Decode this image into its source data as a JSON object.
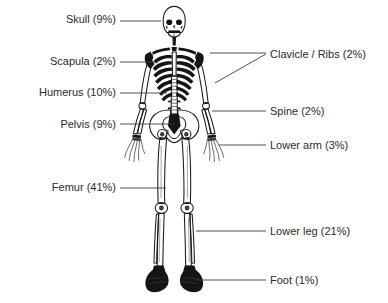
{
  "figure": {
    "background_color": "#ffffff",
    "text_color": "#2b2b2b",
    "line_color": "#3c3c3c",
    "bone_color": "#151515"
  },
  "labels": {
    "skull": {
      "text": "Skull (9%)",
      "side": "left",
      "x": 46,
      "y": 13,
      "width": 70
    },
    "scapula": {
      "text": "Scapula (2%)",
      "side": "left",
      "x": 20,
      "y": 55,
      "width": 96
    },
    "humerus": {
      "text": "Humerus (10%)",
      "side": "left",
      "x": 10,
      "y": 86,
      "width": 106
    },
    "pelvis": {
      "text": "Pelvis (9%)",
      "side": "left",
      "x": 26,
      "y": 118,
      "width": 90
    },
    "femur": {
      "text": "Femur (41%)",
      "side": "left",
      "x": 18,
      "y": 181,
      "width": 98
    },
    "clavicle": {
      "text": "Clavicle / Ribs (2%)",
      "side": "right",
      "x": 270,
      "y": 48,
      "width": 118
    },
    "spine": {
      "text": "Spine (2%)",
      "side": "right",
      "x": 270,
      "y": 105,
      "width": 90
    },
    "lower_arm": {
      "text": "Lower arm (3%)",
      "side": "right",
      "x": 270,
      "y": 139,
      "width": 110
    },
    "lower_leg": {
      "text": "Lower leg (21%)",
      "side": "right",
      "x": 270,
      "y": 225,
      "width": 110
    },
    "foot": {
      "text": "Foot (1%)",
      "side": "right",
      "x": 270,
      "y": 274,
      "width": 90
    }
  },
  "chart_data": {
    "type": "bar",
    "xlabel": "Bone group",
    "ylabel": "Share of skeletal mass (%)",
    "ylim": [
      0,
      45
    ],
    "grid": false,
    "legend": "none",
    "categories": [
      "Skull",
      "Scapula",
      "Humerus",
      "Pelvis",
      "Femur",
      "Clavicle / Ribs",
      "Spine",
      "Lower arm",
      "Lower leg",
      "Foot"
    ],
    "values": [
      9,
      2,
      10,
      9,
      41,
      2,
      2,
      3,
      21,
      1
    ],
    "units": "%",
    "total": 100,
    "annotations": [
      "Skull (9%)",
      "Scapula (2%)",
      "Humerus (10%)",
      "Pelvis (9%)",
      "Femur (41%)",
      "Clavicle / Ribs (2%)",
      "Spine (2%)",
      "Lower arm (3%)",
      "Lower leg (21%)",
      "Foot (1%)"
    ]
  }
}
